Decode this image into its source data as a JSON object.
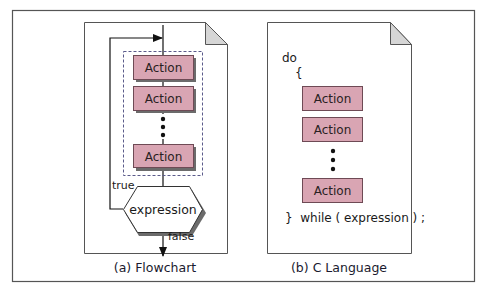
{
  "colors": {
    "action_fill": "#d9a5b3",
    "action_stroke": "#6e4a55",
    "shadow": "#6b6b6b",
    "page_stroke": "#555555",
    "corner_fill": "#d6d6d6",
    "dashed_stroke": "#5a5a8a",
    "frame_stroke": "#555555"
  },
  "flowchart": {
    "caption": "(a) Flowchart",
    "actions": [
      "Action",
      "Action",
      "Action"
    ],
    "ellipsis_dots": 3,
    "decision": "expression",
    "true_label": "true",
    "false_label": "false"
  },
  "c_language": {
    "caption": "(b) C Language",
    "do_keyword": "do",
    "open_brace": "{",
    "actions": [
      "Action",
      "Action",
      "Action"
    ],
    "ellipsis_dots": 3,
    "closing_line": "}  while ( expression ) ;"
  }
}
